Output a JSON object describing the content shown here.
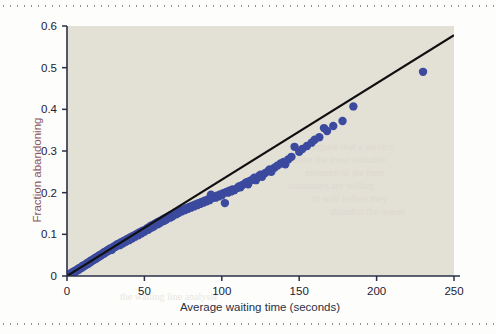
{
  "figure": {
    "background_color": "#fdfdfb",
    "plot_background_color": "#e3e0d6",
    "rule_color": "#8d8f9a"
  },
  "chart_data": {
    "type": "scatter",
    "title": "",
    "subtitle": "",
    "xlabel": "Average waiting time (seconds)",
    "ylabel": "Fraction abandoning",
    "xlim": [
      0,
      250
    ],
    "ylim": [
      0,
      0.6
    ],
    "xticks": [
      0,
      50,
      100,
      150,
      200,
      250
    ],
    "yticks": [
      0,
      0.1,
      0.2,
      0.3,
      0.4,
      0.5,
      0.6
    ],
    "xtick_labels": [
      "0",
      "50",
      "100",
      "150",
      "200",
      "250"
    ],
    "ytick_labels": [
      "0",
      "0.1",
      "0.2",
      "0.3",
      "0.4",
      "0.5",
      "0.6"
    ],
    "grid": false,
    "legend": null,
    "marker_color": "#3b4a9e",
    "marker_size": 4.2,
    "series": [
      {
        "name": "Call centre observations",
        "type": "scatter",
        "points": [
          [
            1,
            0.003
          ],
          [
            2,
            0.005
          ],
          [
            2.5,
            0.004
          ],
          [
            3,
            0.008
          ],
          [
            3.5,
            0.006
          ],
          [
            4,
            0.01
          ],
          [
            4.5,
            0.009
          ],
          [
            5,
            0.012
          ],
          [
            5.5,
            0.011
          ],
          [
            6,
            0.014
          ],
          [
            6.5,
            0.013
          ],
          [
            7,
            0.017
          ],
          [
            7.5,
            0.015
          ],
          [
            8,
            0.019
          ],
          [
            8.5,
            0.018
          ],
          [
            9,
            0.021
          ],
          [
            9.5,
            0.02
          ],
          [
            10,
            0.024
          ],
          [
            10.5,
            0.022
          ],
          [
            11,
            0.026
          ],
          [
            11.5,
            0.025
          ],
          [
            12,
            0.028
          ],
          [
            12.5,
            0.027
          ],
          [
            13,
            0.031
          ],
          [
            13.5,
            0.029
          ],
          [
            14,
            0.033
          ],
          [
            14.5,
            0.032
          ],
          [
            15,
            0.036
          ],
          [
            15.5,
            0.034
          ],
          [
            16,
            0.038
          ],
          [
            16.5,
            0.037
          ],
          [
            17,
            0.04
          ],
          [
            17.5,
            0.039
          ],
          [
            18,
            0.043
          ],
          [
            18.5,
            0.041
          ],
          [
            19,
            0.045
          ],
          [
            19.5,
            0.044
          ],
          [
            20,
            0.047
          ],
          [
            20.5,
            0.046
          ],
          [
            21,
            0.05
          ],
          [
            21.5,
            0.048
          ],
          [
            22,
            0.052
          ],
          [
            22.5,
            0.051
          ],
          [
            23,
            0.054
          ],
          [
            23.5,
            0.053
          ],
          [
            24,
            0.057
          ],
          [
            24.5,
            0.055
          ],
          [
            25,
            0.059
          ],
          [
            25.5,
            0.058
          ],
          [
            26,
            0.061
          ],
          [
            26.5,
            0.06
          ],
          [
            27,
            0.064
          ],
          [
            27.5,
            0.062
          ],
          [
            28,
            0.066
          ],
          [
            28.5,
            0.065
          ],
          [
            29,
            0.063
          ],
          [
            29.5,
            0.068
          ],
          [
            30,
            0.07
          ],
          [
            30.5,
            0.069
          ],
          [
            31,
            0.072
          ],
          [
            31.5,
            0.071
          ],
          [
            32,
            0.075
          ],
          [
            32.5,
            0.073
          ],
          [
            33,
            0.077
          ],
          [
            33.5,
            0.076
          ],
          [
            34,
            0.074
          ],
          [
            34.5,
            0.079
          ],
          [
            35,
            0.081
          ],
          [
            35.5,
            0.08
          ],
          [
            36,
            0.078
          ],
          [
            36.5,
            0.083
          ],
          [
            37,
            0.085
          ],
          [
            37.5,
            0.084
          ],
          [
            38,
            0.082
          ],
          [
            38.5,
            0.087
          ],
          [
            39,
            0.089
          ],
          [
            39.5,
            0.088
          ],
          [
            40,
            0.086
          ],
          [
            40.5,
            0.091
          ],
          [
            41,
            0.093
          ],
          [
            41.5,
            0.092
          ],
          [
            42,
            0.09
          ],
          [
            42.5,
            0.095
          ],
          [
            43,
            0.097
          ],
          [
            43.5,
            0.096
          ],
          [
            44,
            0.094
          ],
          [
            44.5,
            0.099
          ],
          [
            45,
            0.101
          ],
          [
            45.5,
            0.1
          ],
          [
            46,
            0.098
          ],
          [
            46.5,
            0.103
          ],
          [
            47,
            0.105
          ],
          [
            47.5,
            0.104
          ],
          [
            48,
            0.102
          ],
          [
            48.5,
            0.107
          ],
          [
            49,
            0.109
          ],
          [
            49.5,
            0.108
          ],
          [
            50,
            0.106
          ],
          [
            51,
            0.112
          ],
          [
            52,
            0.115
          ],
          [
            52.5,
            0.111
          ],
          [
            53,
            0.117
          ],
          [
            54,
            0.12
          ],
          [
            54.5,
            0.116
          ],
          [
            55,
            0.122
          ],
          [
            56,
            0.119
          ],
          [
            56.5,
            0.125
          ],
          [
            57,
            0.123
          ],
          [
            58,
            0.128
          ],
          [
            58.5,
            0.124
          ],
          [
            59,
            0.13
          ],
          [
            60,
            0.127
          ],
          [
            60.5,
            0.133
          ],
          [
            61,
            0.131
          ],
          [
            62,
            0.136
          ],
          [
            62.5,
            0.132
          ],
          [
            63,
            0.138
          ],
          [
            64,
            0.135
          ],
          [
            64.5,
            0.141
          ],
          [
            65,
            0.139
          ],
          [
            66,
            0.144
          ],
          [
            66.5,
            0.14
          ],
          [
            67,
            0.146
          ],
          [
            68,
            0.143
          ],
          [
            68.5,
            0.149
          ],
          [
            69,
            0.147
          ],
          [
            70,
            0.152
          ],
          [
            70.5,
            0.148
          ],
          [
            71,
            0.154
          ],
          [
            72,
            0.151
          ],
          [
            73,
            0.157
          ],
          [
            74,
            0.155
          ],
          [
            75,
            0.16
          ],
          [
            76,
            0.158
          ],
          [
            77,
            0.163
          ],
          [
            78,
            0.161
          ],
          [
            79,
            0.166
          ],
          [
            80,
            0.164
          ],
          [
            81,
            0.169
          ],
          [
            82,
            0.167
          ],
          [
            83,
            0.172
          ],
          [
            84,
            0.17
          ],
          [
            85,
            0.175
          ],
          [
            86,
            0.173
          ],
          [
            87,
            0.178
          ],
          [
            88,
            0.176
          ],
          [
            89,
            0.181
          ],
          [
            90,
            0.179
          ],
          [
            91,
            0.184
          ],
          [
            92,
            0.182
          ],
          [
            93,
            0.195
          ],
          [
            94,
            0.187
          ],
          [
            95,
            0.19
          ],
          [
            96,
            0.188
          ],
          [
            97,
            0.193
          ],
          [
            98,
            0.191
          ],
          [
            99,
            0.196
          ],
          [
            100,
            0.194
          ],
          [
            101,
            0.199
          ],
          [
            102,
            0.175
          ],
          [
            103,
            0.202
          ],
          [
            104,
            0.2
          ],
          [
            105,
            0.205
          ],
          [
            106,
            0.203
          ],
          [
            107,
            0.208
          ],
          [
            108,
            0.206
          ],
          [
            110,
            0.211
          ],
          [
            111,
            0.215
          ],
          [
            112,
            0.213
          ],
          [
            113,
            0.218
          ],
          [
            115,
            0.222
          ],
          [
            116,
            0.225
          ],
          [
            117,
            0.22
          ],
          [
            118,
            0.228
          ],
          [
            120,
            0.232
          ],
          [
            121,
            0.236
          ],
          [
            122,
            0.23
          ],
          [
            124,
            0.24
          ],
          [
            125,
            0.243
          ],
          [
            126,
            0.238
          ],
          [
            128,
            0.247
          ],
          [
            130,
            0.252
          ],
          [
            131,
            0.256
          ],
          [
            132,
            0.25
          ],
          [
            134,
            0.26
          ],
          [
            136,
            0.265
          ],
          [
            138,
            0.27
          ],
          [
            140,
            0.274
          ],
          [
            141,
            0.268
          ],
          [
            143,
            0.28
          ],
          [
            145,
            0.286
          ],
          [
            147,
            0.31
          ],
          [
            150,
            0.298
          ],
          [
            152,
            0.305
          ],
          [
            155,
            0.312
          ],
          [
            158,
            0.32
          ],
          [
            160,
            0.327
          ],
          [
            163,
            0.333
          ],
          [
            166,
            0.355
          ],
          [
            168,
            0.348
          ],
          [
            172,
            0.36
          ],
          [
            178,
            0.372
          ],
          [
            185,
            0.407
          ],
          [
            230,
            0.49
          ]
        ]
      },
      {
        "name": "Linear fit",
        "type": "line",
        "color": "#101010",
        "x": [
          0,
          250
        ],
        "y": [
          0.0,
          0.578
        ]
      }
    ],
    "annotations": []
  }
}
